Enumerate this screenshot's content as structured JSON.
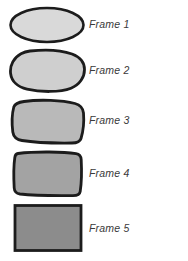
{
  "figure": {
    "background_color": "#ffffff",
    "outline_color": "#1a1a1a",
    "width": 188,
    "height": 261
  },
  "frames": [
    {
      "id": "frame-1",
      "label": "Frame 1",
      "shape": "ellipse",
      "fill_color": "#d9d9d9",
      "stroke_color": "#1c1c1c",
      "stroke_width": 2.6,
      "label_x": 89,
      "label_y": 19,
      "box": {
        "x": 9,
        "y": 7,
        "w": 74,
        "h": 35
      }
    },
    {
      "id": "frame-2",
      "label": "Frame 2",
      "shape": "rounded-blob",
      "fill_color": "#cfcfcf",
      "stroke_color": "#1c1c1c",
      "stroke_width": 2.8,
      "label_x": 89,
      "label_y": 65,
      "box": {
        "x": 9,
        "y": 50,
        "w": 74,
        "h": 42
      }
    },
    {
      "id": "frame-3",
      "label": "Frame 3",
      "shape": "rounded-square-blob",
      "fill_color": "#b9b9b9",
      "stroke_color": "#1c1c1c",
      "stroke_width": 2.8,
      "label_x": 89,
      "label_y": 115,
      "box": {
        "x": 9,
        "y": 99,
        "w": 74,
        "h": 44
      }
    },
    {
      "id": "frame-4",
      "label": "Frame 4",
      "shape": "soft-rectangle",
      "fill_color": "#a3a3a3",
      "stroke_color": "#1c1c1c",
      "stroke_width": 2.8,
      "label_x": 89,
      "label_y": 168,
      "box": {
        "x": 9,
        "y": 150,
        "w": 74,
        "h": 46
      }
    },
    {
      "id": "frame-5",
      "label": "Frame 5",
      "shape": "rectangle",
      "fill_color": "#8c8c8c",
      "stroke_color": "#1c1c1c",
      "stroke_width": 2.8,
      "label_x": 89,
      "label_y": 223,
      "box": {
        "x": 9,
        "y": 204,
        "w": 74,
        "h": 48
      }
    }
  ]
}
